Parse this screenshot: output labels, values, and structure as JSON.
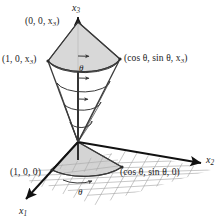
{
  "figure": {
    "background_color": "#ffffff",
    "line_color": "#3a3a3a",
    "axis_color": "#111111",
    "surface_fill": "#d6d6d6",
    "grid_color": "#9a9a9a",
    "text_color": "#1a1a1a"
  },
  "axes": [
    {
      "id": "x3",
      "name": "x3-axis",
      "label_main": "x",
      "label_sub": "3",
      "x": 72,
      "y": 3
    },
    {
      "id": "x2",
      "name": "x2-axis",
      "label_main": "x",
      "label_sub": "2",
      "x": 206,
      "y": 155
    },
    {
      "id": "x1",
      "name": "x1-axis",
      "label_main": "x",
      "label_sub": "1",
      "x": 19,
      "y": 206
    }
  ],
  "point_labels": [
    {
      "id": "top-apex",
      "name": "label-origin-top",
      "text": "(0, 0, x",
      "sub": "3",
      "tail": ")",
      "x": 25,
      "y": 17
    },
    {
      "id": "left-rim",
      "name": "label-one-zero-x3",
      "text": "(1, 0, x",
      "sub": "3",
      "tail": ")",
      "x": 2,
      "y": 55
    },
    {
      "id": "right-rim",
      "name": "label-cos-sin-x3",
      "text": "(cos θ, sin θ, x",
      "sub": "3",
      "tail": ")",
      "x": 124,
      "y": 54
    },
    {
      "id": "base-left",
      "name": "label-one-zero-zero",
      "text": "(1, 0, 0)",
      "sub": "",
      "tail": "",
      "x": 10,
      "y": 168
    },
    {
      "id": "base-right",
      "name": "label-cos-sin-zero",
      "text": "(cos θ, sin θ, 0)",
      "sub": "",
      "tail": "",
      "x": 120,
      "y": 168
    }
  ],
  "angle_labels": [
    {
      "id": "theta-cone",
      "name": "label-theta-cone",
      "text": "θ",
      "x": 79,
      "y": 64
    },
    {
      "id": "theta-base",
      "name": "label-theta-base",
      "text": "θ",
      "x": 78,
      "y": 188
    }
  ],
  "geometry": {
    "origin": {
      "x": 78,
      "y": 142
    },
    "cone_apex_top": {
      "x": 78,
      "y": 22
    },
    "rim_left": {
      "x": 48,
      "y": 61
    },
    "rim_right": {
      "x": 120,
      "y": 59
    },
    "base_left": {
      "x": 52,
      "y": 170
    },
    "base_right": {
      "x": 122,
      "y": 167
    },
    "grid_rows": 6,
    "grid_cols": 6
  }
}
